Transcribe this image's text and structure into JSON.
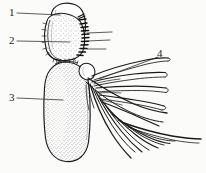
{
  "figure": {
    "kind": "scientific-line-drawing",
    "background_color": "#fbfbf9",
    "ink_color": "#1a1a1a",
    "stipple_color": "#555555",
    "width": 206,
    "height": 173
  },
  "labels": [
    {
      "id": "1",
      "text": "1",
      "x": 9,
      "y": 7,
      "leader": {
        "x1": 17,
        "y1": 13,
        "x2": 60,
        "y2": 15
      }
    },
    {
      "id": "2",
      "text": "2",
      "x": 9,
      "y": 35,
      "leader": {
        "x1": 17,
        "y1": 41,
        "x2": 70,
        "y2": 42
      }
    },
    {
      "id": "3",
      "text": "3",
      "x": 9,
      "y": 92,
      "leader": {
        "x1": 17,
        "y1": 98,
        "x2": 63,
        "y2": 100
      }
    },
    {
      "id": "4",
      "text": "4",
      "x": 157,
      "y": 48,
      "leader": {
        "x1": 158,
        "y1": 57,
        "x2": 99,
        "y2": 79
      }
    }
  ],
  "unlabeled_leaders": [
    {
      "x1": 87,
      "y1": 33,
      "x2": 112,
      "y2": 32
    },
    {
      "x1": 87,
      "y1": 41,
      "x2": 110,
      "y2": 40
    },
    {
      "x1": 87,
      "y1": 49,
      "x2": 106,
      "y2": 49
    }
  ],
  "parts": [
    {
      "ref": "1",
      "name": "distal-cap-segment",
      "description": "smooth rounded apical lobe at top"
    },
    {
      "ref": "2",
      "name": "stippled-middle-segment",
      "description": "stippled segment bearing marginal setae on right edge"
    },
    {
      "ref": "3",
      "name": "elongate-basal-lobe",
      "description": "large elongate stippled oval body"
    },
    {
      "ref": "4",
      "name": "lamellate-filaments",
      "description": "fan of elongate leaf-like gill lamellae and hair-like setae"
    }
  ]
}
